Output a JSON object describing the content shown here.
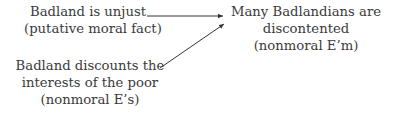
{
  "diagram": {
    "nodes": [
      {
        "id": "n1",
        "lines": [
          "Badland is unjust",
          "(putative moral fact)"
        ]
      },
      {
        "id": "n2",
        "lines": [
          "Many Badlandians are",
          "discontented",
          "(nonmoral E’m)"
        ]
      },
      {
        "id": "n3",
        "lines": [
          "Badland discounts the",
          "interests of the poor",
          "(nonmoral E’s)"
        ]
      }
    ],
    "edges": [
      {
        "from": "n1",
        "to": "n2"
      },
      {
        "from": "n3",
        "to": "n2"
      }
    ],
    "colors": {
      "text": "#3a3a3a",
      "arrow": "#333333",
      "background": "#ffffff"
    }
  }
}
